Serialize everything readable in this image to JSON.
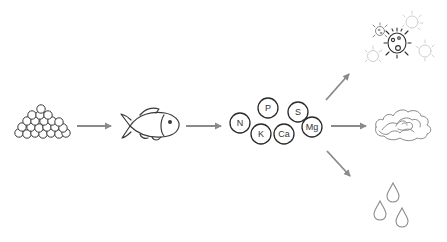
{
  "diagram": {
    "title": "",
    "colors": {
      "stroke": "#3a3a3a",
      "arrow": "#8a8a8a",
      "faint": "#c8c8c8",
      "background": "#ffffff"
    },
    "nodes": [
      {
        "id": "fish-feed",
        "icon": "egg-pile-icon"
      },
      {
        "id": "fish",
        "icon": "fish-icon"
      },
      {
        "id": "nutrients",
        "icon": "nutrient-bubbles",
        "elements": [
          "N",
          "P",
          "K",
          "S",
          "Ca",
          "Mg"
        ]
      },
      {
        "id": "microbes",
        "icon": "bacteria-icon"
      },
      {
        "id": "plants",
        "icon": "lettuce-icon"
      },
      {
        "id": "water",
        "icon": "water-drops-icon"
      }
    ],
    "edges": [
      {
        "from": "fish-feed",
        "to": "fish"
      },
      {
        "from": "fish",
        "to": "nutrients"
      },
      {
        "from": "nutrients",
        "to": "microbes"
      },
      {
        "from": "nutrients",
        "to": "plants"
      },
      {
        "from": "nutrients",
        "to": "water"
      }
    ],
    "nutrients": {
      "n": "N",
      "p": "P",
      "k": "K",
      "s": "S",
      "ca": "Ca",
      "mg": "Mg"
    }
  }
}
